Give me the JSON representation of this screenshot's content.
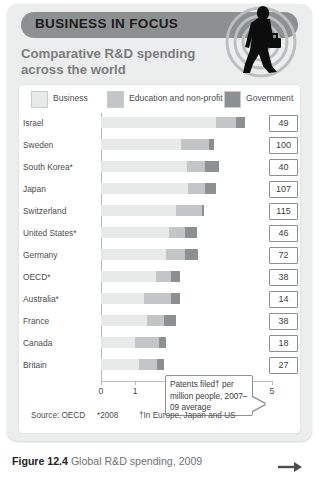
{
  "banner": {
    "title": "BUSINESS IN FOCUS"
  },
  "subtitle": "Comparative R&D spending across the world",
  "deco": {
    "icon": "walking-businessman-silhouette-icon"
  },
  "caption": {
    "figure_number": "Figure 12.4",
    "text": " Global R&D spending, 2009",
    "arrow": "➡"
  },
  "callout": {
    "text": "Patents filed† per million people, 2007–09 average"
  },
  "source": {
    "source_label": "Source: OECD",
    "note_star": "*2008",
    "note_dagger": "†In Europe, Japan and US"
  },
  "chart_data": {
    "type": "bar",
    "orientation": "horizontal",
    "stacked": true,
    "title": "Comparative R&D spending across the world",
    "xlabel": "R&D spending as % of GDP",
    "ylabel": "",
    "xlim": [
      0,
      5
    ],
    "xticks": [
      0,
      1,
      2,
      3,
      4,
      5
    ],
    "xtick_labels": [
      "0",
      "1",
      "2",
      "3",
      "4",
      "5"
    ],
    "grid": false,
    "legend_position": "top",
    "colors": {
      "business": "#e8e9e9",
      "education": "#c3c5c6",
      "government": "#8d9091",
      "banner": "#8d9091",
      "card_bg": "#eceded",
      "panel_bg": "#ffffff",
      "text": "#4b4d4e",
      "subtitle": "#7b7e80"
    },
    "legend": [
      {
        "key": "business",
        "label": "Business"
      },
      {
        "key": "education",
        "label": "Education and non-profit"
      },
      {
        "key": "government",
        "label": "Government"
      }
    ],
    "categories": [
      "Israel",
      "Sweden",
      "South Korea*",
      "Japan",
      "Switzerland",
      "United States*",
      "Germany",
      "OECD*",
      "Australia*",
      "France",
      "Canada",
      "Britain"
    ],
    "series": [
      {
        "name": "Business",
        "values": [
          3.35,
          2.35,
          2.5,
          2.55,
          2.2,
          2.0,
          1.9,
          1.6,
          1.25,
          1.35,
          1.0,
          1.1
        ]
      },
      {
        "name": "Education and non-profit",
        "values": [
          0.6,
          0.8,
          0.55,
          0.5,
          0.75,
          0.45,
          0.55,
          0.45,
          0.8,
          0.5,
          0.7,
          0.55
        ]
      },
      {
        "name": "Government",
        "values": [
          0.25,
          0.15,
          0.4,
          0.3,
          0.05,
          0.35,
          0.4,
          0.25,
          0.25,
          0.35,
          0.2,
          0.2
        ]
      }
    ],
    "value_box_label": "Patents filed† per million people, 2007–09 average",
    "value_boxes": [
      49,
      100,
      40,
      107,
      115,
      46,
      72,
      38,
      14,
      38,
      18,
      27
    ]
  }
}
